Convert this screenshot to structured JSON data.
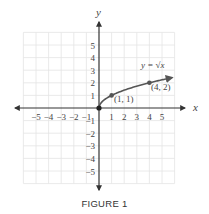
{
  "chart_data": {
    "type": "line",
    "title": "",
    "caption": "FIGURE 1",
    "xlabel": "x",
    "ylabel": "y",
    "xlim": [
      -6,
      6
    ],
    "ylim": [
      -6,
      6
    ],
    "grid": true,
    "x_ticks": [
      -5,
      -4,
      -3,
      -2,
      -1,
      1,
      2,
      3,
      4,
      5
    ],
    "y_ticks": [
      -5,
      -4,
      -3,
      -2,
      -1,
      1,
      2,
      3,
      4,
      5
    ],
    "x_tick_labels": [
      "−5",
      "−4",
      "−3",
      "−2",
      "−1",
      "1",
      "2",
      "3",
      "4",
      "5"
    ],
    "y_tick_labels": [
      "−5",
      "−4",
      "−3",
      "−2",
      "−1",
      "1",
      "2",
      "3",
      "4",
      "5"
    ],
    "series": [
      {
        "name": "y = √x",
        "function": "sqrt",
        "x_range": [
          0,
          5.8
        ],
        "x": [
          0,
          0.25,
          1,
          2,
          3,
          4,
          5,
          5.8
        ],
        "y": [
          0,
          0.5,
          1,
          1.414,
          1.732,
          2,
          2.236,
          2.408
        ],
        "color": "#555555"
      }
    ],
    "points": [
      {
        "x": 0,
        "y": 0,
        "label": ""
      },
      {
        "x": 1,
        "y": 1,
        "label": "(1, 1)"
      },
      {
        "x": 4,
        "y": 2,
        "label": "(4, 2)"
      }
    ],
    "annotations": [
      {
        "text": "y = √x",
        "x": 3.4,
        "y": 3
      }
    ]
  },
  "labels": {
    "x_axis": "x",
    "y_axis": "y",
    "curve": "y = √x",
    "point_1": "(1, 1)",
    "point_2": "(4, 2)",
    "caption": "FIGURE 1"
  }
}
